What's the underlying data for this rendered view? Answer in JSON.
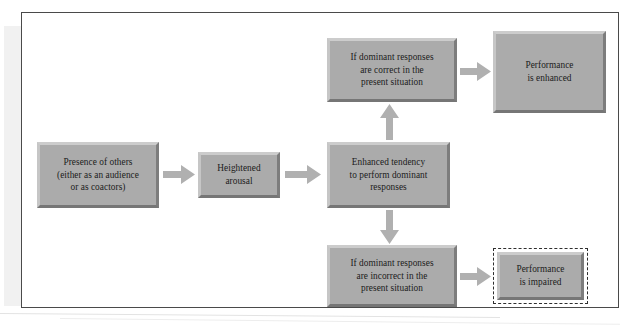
{
  "diagram": {
    "type": "flowchart",
    "nodes": [
      {
        "id": "presence-of-others",
        "label": "Presence of others\n(either as an audience\nor as coactors)",
        "style": "beveled-gray"
      },
      {
        "id": "heightened-arousal",
        "label": "Heightened\narousal",
        "style": "beveled-gray"
      },
      {
        "id": "enhanced-tendency",
        "label": "Enhanced tendency\nto perform dominant\nresponses",
        "style": "beveled-gray"
      },
      {
        "id": "dominant-correct",
        "label": "If dominant responses\nare correct in the\npresent situation",
        "style": "beveled-gray"
      },
      {
        "id": "performance-enhanced",
        "label": "Performance\nis enhanced",
        "style": "beveled-gray"
      },
      {
        "id": "dominant-incorrect",
        "label": "If dominant responses\nare incorrect in the\npresent situation",
        "style": "beveled-gray"
      },
      {
        "id": "performance-impaired",
        "label": "Performance\nis impaired",
        "style": "beveled-gray-dashed-outline"
      }
    ],
    "edges": [
      {
        "from": "presence-of-others",
        "to": "heightened-arousal",
        "direction": "right"
      },
      {
        "from": "heightened-arousal",
        "to": "enhanced-tendency",
        "direction": "right"
      },
      {
        "from": "enhanced-tendency",
        "to": "dominant-correct",
        "direction": "up"
      },
      {
        "from": "enhanced-tendency",
        "to": "dominant-incorrect",
        "direction": "down"
      },
      {
        "from": "dominant-correct",
        "to": "performance-enhanced",
        "direction": "right"
      },
      {
        "from": "dominant-incorrect",
        "to": "performance-impaired",
        "direction": "right"
      }
    ]
  },
  "colors": {
    "box_fill": "#ababab",
    "box_bevel_light": "#cccccc",
    "box_bevel_dark": "#767676",
    "arrow_fill": "#b0b0b0",
    "frame_border": "#4a4a4a",
    "dashed_outline": "#2e2e2e",
    "page_background": "#ffffff"
  }
}
